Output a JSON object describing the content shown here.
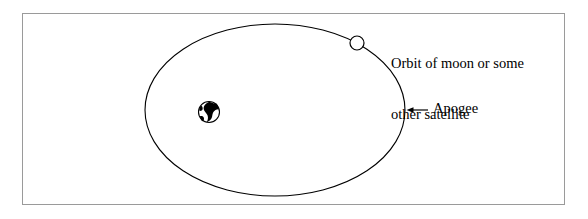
{
  "figure": {
    "type": "orbital-diagram",
    "background_color": "#ffffff",
    "frame": {
      "name": "figure-border",
      "border_color": "#9a9a9a",
      "fill": "#ffffff"
    },
    "stroke_color": "#000000"
  },
  "labels": {
    "orbit": {
      "line1": "Orbit of moon or some",
      "line2": "other satellite"
    },
    "apogee": "Apogee"
  },
  "elements": {
    "orbit_ellipse": {
      "name": "orbit-ellipse",
      "cx": 275,
      "cy": 110,
      "rx": 130,
      "ry": 86,
      "fill": "none",
      "stroke": "#000000"
    },
    "earth": {
      "name": "earth-globe-icon",
      "cx": 209,
      "cy": 112,
      "r": 11,
      "fill": "#ffffff",
      "stroke": "#000000",
      "landmass_color": "#000000"
    },
    "satellite": {
      "name": "satellite-moon-icon",
      "cx": 357,
      "cy": 43,
      "r": 7,
      "fill": "#ffffff",
      "stroke": "#000000"
    },
    "apogee_arrow": {
      "name": "apogee-arrow-icon",
      "from_x": 428,
      "to_x": 408,
      "y": 110,
      "direction": "left",
      "stroke": "#000000"
    }
  }
}
